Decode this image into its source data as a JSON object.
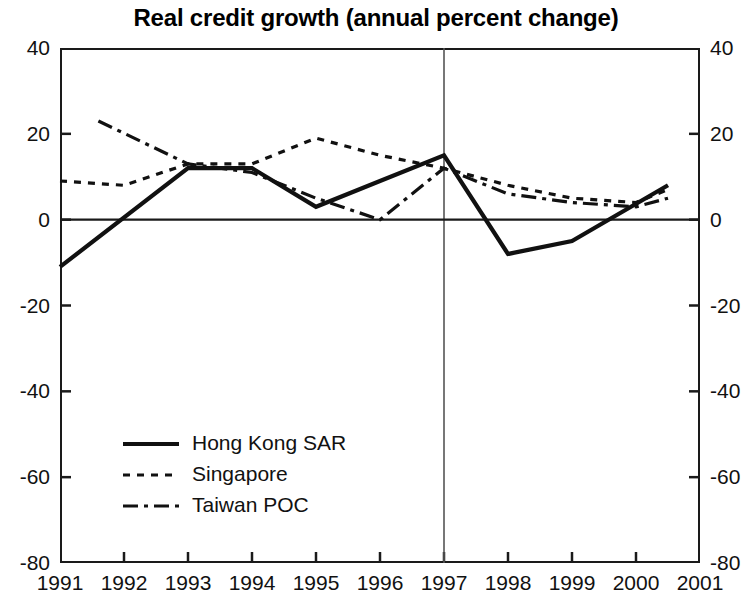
{
  "chart_data": {
    "type": "line",
    "title": "Real credit growth (annual percent change)",
    "xlabel": "",
    "ylabel": "",
    "ylim": [
      -80,
      40
    ],
    "xlim": [
      1991,
      2001
    ],
    "yticks": [
      40,
      20,
      0,
      -20,
      -40,
      -60,
      -80
    ],
    "xticks": [
      "1991",
      "1992",
      "1993",
      "1994",
      "1995",
      "1996",
      "1997",
      "1998",
      "1999",
      "2000",
      "2001"
    ],
    "grid": false,
    "legend_position": "lower-left",
    "dual_axis": true,
    "annotations": [
      {
        "type": "vertical-line",
        "x": 1997,
        "label": ""
      },
      {
        "type": "horizontal-line",
        "y": 0,
        "label": ""
      }
    ],
    "series": [
      {
        "name": "Hong Kong SAR",
        "style": "solid",
        "color": "#111111",
        "points": [
          {
            "x": 1991.0,
            "y": -11
          },
          {
            "x": 1993.0,
            "y": 12
          },
          {
            "x": 1994.0,
            "y": 12
          },
          {
            "x": 1995.0,
            "y": 3
          },
          {
            "x": 1996.0,
            "y": 9
          },
          {
            "x": 1997.0,
            "y": 15
          },
          {
            "x": 1998.0,
            "y": -8
          },
          {
            "x": 1999.0,
            "y": -5
          },
          {
            "x": 2000.5,
            "y": 8
          }
        ]
      },
      {
        "name": "Singapore",
        "style": "dotted",
        "color": "#111111",
        "points": [
          {
            "x": 1991.0,
            "y": 9
          },
          {
            "x": 1992.0,
            "y": 8
          },
          {
            "x": 1993.0,
            "y": 13
          },
          {
            "x": 1994.0,
            "y": 13
          },
          {
            "x": 1995.0,
            "y": 19
          },
          {
            "x": 1996.0,
            "y": 15
          },
          {
            "x": 1997.0,
            "y": 12
          },
          {
            "x": 1998.0,
            "y": 8
          },
          {
            "x": 1999.0,
            "y": 5
          },
          {
            "x": 2000.0,
            "y": 4
          },
          {
            "x": 2000.5,
            "y": 7
          }
        ]
      },
      {
        "name": "Taiwan POC",
        "style": "dash-dot",
        "color": "#111111",
        "points": [
          {
            "x": 1991.6,
            "y": 23
          },
          {
            "x": 1993.0,
            "y": 13
          },
          {
            "x": 1994.0,
            "y": 11
          },
          {
            "x": 1995.0,
            "y": 5
          },
          {
            "x": 1996.0,
            "y": 0
          },
          {
            "x": 1997.0,
            "y": 12
          },
          {
            "x": 1998.0,
            "y": 6
          },
          {
            "x": 1999.0,
            "y": 4
          },
          {
            "x": 2000.0,
            "y": 3
          },
          {
            "x": 2000.5,
            "y": 5
          }
        ]
      }
    ]
  },
  "legend": {
    "items": [
      {
        "label": "Hong Kong SAR",
        "style": "solid"
      },
      {
        "label": "Singapore",
        "style": "dotted"
      },
      {
        "label": "Taiwan POC",
        "style": "dash-dot"
      }
    ]
  }
}
